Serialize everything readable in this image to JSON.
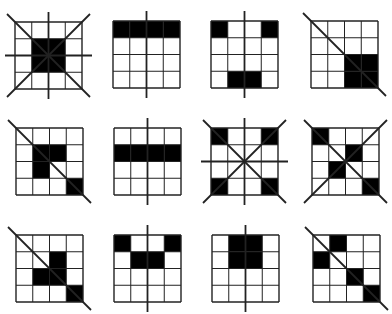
{
  "diagram": {
    "type": "figure-reasoning-puzzle",
    "grid_size": 4,
    "colors": {
      "fill": "#000000",
      "line": "#222222",
      "background": "#ffffff"
    },
    "panels": [
      {
        "id": "r1c1",
        "row": 1,
        "col": 1,
        "x": 15,
        "y": 22,
        "filled": [
          [
            1,
            1
          ],
          [
            1,
            2
          ],
          [
            2,
            1
          ],
          [
            2,
            2
          ]
        ],
        "lines": [
          "diag-main",
          "diag-anti",
          "vertical",
          "horizontal"
        ],
        "line_style": "through-outside-only"
      },
      {
        "id": "r1c2",
        "row": 1,
        "col": 2,
        "x": 113,
        "y": 21,
        "filled": [
          [
            0,
            0
          ],
          [
            0,
            1
          ],
          [
            0,
            2
          ],
          [
            0,
            3
          ]
        ],
        "lines": [
          "vertical"
        ]
      },
      {
        "id": "r1c3",
        "row": 1,
        "col": 3,
        "x": 211,
        "y": 21,
        "filled": [
          [
            0,
            0
          ],
          [
            0,
            3
          ],
          [
            3,
            1
          ],
          [
            3,
            2
          ]
        ],
        "lines": [
          "vertical"
        ]
      },
      {
        "id": "r1c4",
        "row": 1,
        "col": 4,
        "x": 311,
        "y": 21,
        "filled": [
          [
            2,
            2
          ],
          [
            2,
            3
          ],
          [
            3,
            2
          ],
          [
            3,
            3
          ]
        ],
        "lines": [
          "diag-main"
        ]
      },
      {
        "id": "r2c1",
        "row": 2,
        "col": 1,
        "x": 16,
        "y": 128,
        "filled": [
          [
            1,
            1
          ],
          [
            1,
            2
          ],
          [
            2,
            1
          ],
          [
            3,
            3
          ]
        ],
        "lines": [
          "diag-main"
        ]
      },
      {
        "id": "r2c2",
        "row": 2,
        "col": 2,
        "x": 114,
        "y": 128,
        "filled": [
          [
            1,
            0
          ],
          [
            1,
            1
          ],
          [
            1,
            2
          ],
          [
            1,
            3
          ]
        ],
        "lines": [
          "vertical"
        ]
      },
      {
        "id": "r2c3",
        "row": 2,
        "col": 3,
        "x": 211,
        "y": 128,
        "filled": [
          [
            0,
            0
          ],
          [
            0,
            3
          ],
          [
            3,
            0
          ],
          [
            3,
            3
          ]
        ],
        "lines": [
          "diag-main",
          "diag-anti",
          "vertical",
          "horizontal"
        ]
      },
      {
        "id": "r2c4",
        "row": 2,
        "col": 4,
        "x": 312,
        "y": 128,
        "filled": [
          [
            0,
            0
          ],
          [
            1,
            2
          ],
          [
            2,
            1
          ],
          [
            3,
            3
          ]
        ],
        "lines": [
          "diag-main",
          "diag-anti"
        ]
      },
      {
        "id": "r3c1",
        "row": 3,
        "col": 1,
        "x": 16,
        "y": 235,
        "filled": [
          [
            1,
            2
          ],
          [
            2,
            1
          ],
          [
            2,
            2
          ],
          [
            3,
            3
          ]
        ],
        "lines": [
          "diag-main"
        ]
      },
      {
        "id": "r3c2",
        "row": 3,
        "col": 2,
        "x": 114,
        "y": 235,
        "filled": [
          [
            0,
            0
          ],
          [
            0,
            3
          ],
          [
            1,
            1
          ],
          [
            1,
            2
          ]
        ],
        "lines": [
          "vertical"
        ]
      },
      {
        "id": "r3c3",
        "row": 3,
        "col": 3,
        "x": 212,
        "y": 235,
        "filled": [
          [
            0,
            1
          ],
          [
            0,
            2
          ],
          [
            1,
            1
          ],
          [
            1,
            2
          ]
        ],
        "lines": [
          "vertical"
        ]
      },
      {
        "id": "r3c4",
        "row": 3,
        "col": 4,
        "x": 313,
        "y": 235,
        "filled": [
          [
            0,
            1
          ],
          [
            1,
            0
          ],
          [
            2,
            2
          ],
          [
            3,
            3
          ]
        ],
        "lines": [
          "diag-main"
        ]
      }
    ]
  }
}
